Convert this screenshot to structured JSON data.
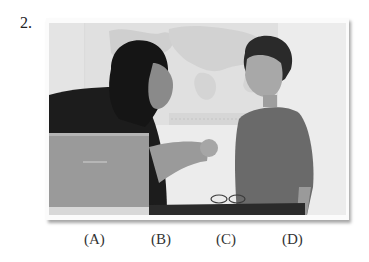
{
  "question": {
    "number": "2."
  },
  "photo": {
    "description": "Woman and boy at a desk with laptop, woman handing the boy an apple, world map on the wall behind",
    "elements": [
      "world-map",
      "woman",
      "boy",
      "apple",
      "laptop",
      "eyeglasses",
      "desk"
    ],
    "style": "grayscale"
  },
  "choices": [
    {
      "label": "(A)"
    },
    {
      "label": "(B)"
    },
    {
      "label": "(C)"
    },
    {
      "label": "(D)"
    }
  ]
}
